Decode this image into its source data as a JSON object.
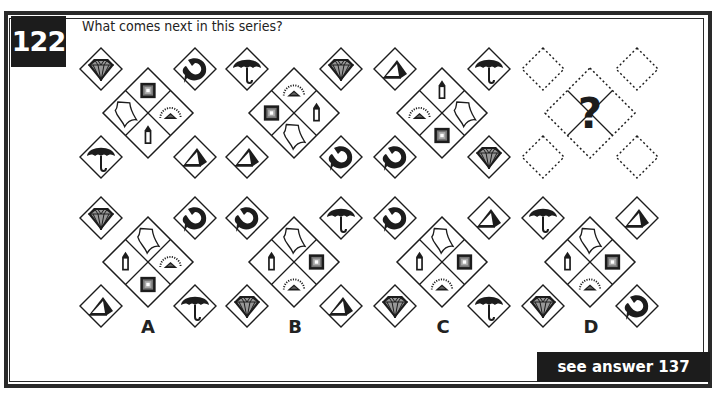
{
  "puzzle": {
    "number": "122",
    "question": "What comes next in this series?",
    "answer_ref": "see answer 137",
    "unknown_marker": "?"
  },
  "series": [
    {
      "id": "fig1",
      "corners": {
        "tl": "diamond",
        "tr": "dolphin",
        "bl": "umbrella",
        "br": "pyramid"
      },
      "center": {
        "top": "square",
        "left": "kite",
        "right": "sunrise",
        "bottom": "bottle"
      }
    },
    {
      "id": "fig2",
      "corners": {
        "tl": "umbrella",
        "tr": "diamond",
        "bl": "pyramid",
        "br": "dolphin"
      },
      "center": {
        "top": "sunrise",
        "left": "square",
        "right": "bottle",
        "bottom": "kite"
      }
    },
    {
      "id": "fig3",
      "corners": {
        "tl": "pyramid",
        "tr": "umbrella",
        "bl": "dolphin",
        "br": "diamond"
      },
      "center": {
        "top": "bottle",
        "left": "sunrise",
        "right": "kite",
        "bottom": "square"
      }
    },
    {
      "id": "fig4",
      "unknown": true
    }
  ],
  "options": [
    {
      "label": "A",
      "corners": {
        "tl": "diamond",
        "tr": "dolphin",
        "bl": "pyramid",
        "br": "umbrella"
      },
      "center": {
        "top": "kite",
        "left": "bottle",
        "right": "sunrise",
        "bottom": "square"
      }
    },
    {
      "label": "B",
      "corners": {
        "tl": "dolphin",
        "tr": "umbrella",
        "bl": "diamond",
        "br": "pyramid"
      },
      "center": {
        "top": "kite",
        "left": "bottle",
        "right": "square",
        "bottom": "sunrise"
      }
    },
    {
      "label": "C",
      "corners": {
        "tl": "dolphin",
        "tr": "pyramid",
        "bl": "diamond",
        "br": "umbrella"
      },
      "center": {
        "top": "kite",
        "left": "bottle",
        "right": "square",
        "bottom": "sunrise"
      }
    },
    {
      "label": "D",
      "corners": {
        "tl": "umbrella",
        "tr": "pyramid",
        "bl": "diamond",
        "br": "dolphin"
      },
      "center": {
        "top": "kite",
        "left": "bottle",
        "right": "square",
        "bottom": "sunrise"
      }
    }
  ],
  "icons": {
    "diamond": "gem-icon",
    "dolphin": "dolphin-icon",
    "umbrella": "umbrella-icon",
    "pyramid": "pyramid-icon",
    "square": "nested-square-icon",
    "kite": "kite-icon",
    "sunrise": "sunrise-icon",
    "bottle": "bottle-icon"
  },
  "colors": {
    "ink": "#1c1c1c",
    "border": "#2a2a2a",
    "background": "#ffffff"
  }
}
